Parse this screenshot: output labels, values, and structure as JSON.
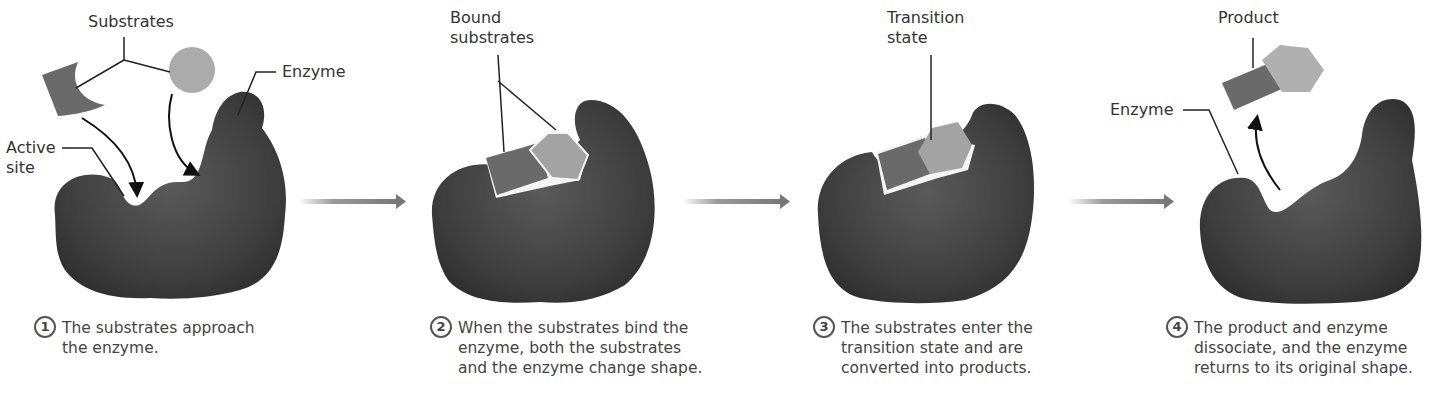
{
  "figure": {
    "colors": {
      "enzyme": "#3d3d3d",
      "substrate_dark": "#6a6a6a",
      "substrate_light": "#a8a8a8",
      "arrow": "#7a7a7a"
    },
    "panels": [
      {
        "step": "1",
        "caption": "The substrates approach\nthe enzyme.",
        "labels": {
          "substrates": "Substrates",
          "enzyme": "Enzyme",
          "active_site": "Active\nsite"
        }
      },
      {
        "step": "2",
        "caption": "When the substrates bind the\nenzyme, both the substrates\nand the enzyme change shape.",
        "labels": {
          "bound_substrates": "Bound\nsubstrates"
        }
      },
      {
        "step": "3",
        "caption": "The substrates enter the\ntransition state and are\nconverted into products.",
        "labels": {
          "transition_state": "Transition\nstate"
        }
      },
      {
        "step": "4",
        "caption": "The product and enzyme\ndissociate, and the enzyme\nreturns to its original shape.",
        "labels": {
          "product": "Product",
          "enzyme": "Enzyme"
        }
      }
    ]
  }
}
